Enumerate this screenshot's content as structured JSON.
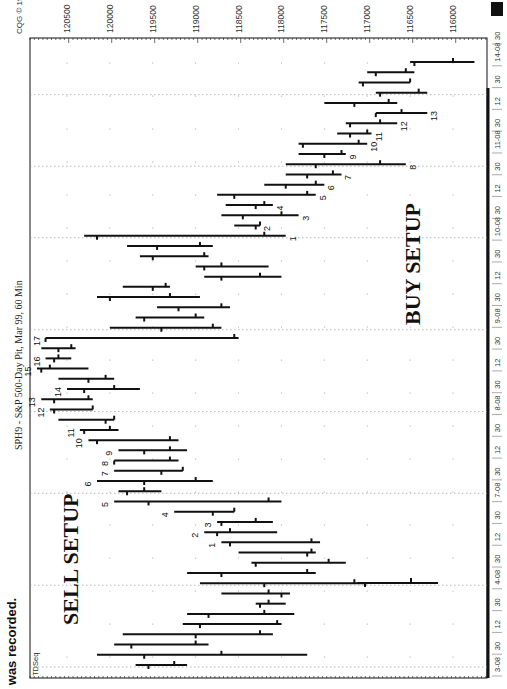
{
  "caption": "was recorded.",
  "chart_data": {
    "type": "ohlc",
    "title": "SPH9 - S&P 500-Day Pit, Mar 99, 60 Min",
    "copyright": "CQG © 1999",
    "indicator_label": "TDSeq",
    "orientation": "rotated 90° counter-clockwise (time runs bottom→top, price decreases left→right)",
    "xlabel": "Time (60-min bars)",
    "ylabel": "Price",
    "y_ticks": [
      120500,
      120000,
      119500,
      119000,
      118500,
      118000,
      117500,
      117000,
      116500,
      116000
    ],
    "ylim": [
      115700,
      120850
    ],
    "x_tick_labels": [
      "3-08",
      "30",
      "12",
      "30",
      "4-08",
      "30",
      "12",
      "30",
      "7-08",
      "30",
      "12",
      "30",
      "8-08",
      "30",
      "12",
      "30",
      "9-08",
      "30",
      "12",
      "30",
      "10-08",
      "30",
      "12",
      "30",
      "11-08",
      "30",
      "12",
      "30",
      "14-08",
      "30"
    ],
    "grid": true,
    "annotations": [
      {
        "text": "SELL SETUP",
        "near_bar": 8
      },
      {
        "text": "BUY SETUP",
        "near_bar": 45
      }
    ],
    "sell_setup_counts": [
      "1",
      "2",
      "3",
      "4",
      "5",
      "6",
      "7",
      "8",
      "9",
      "10",
      "11",
      "12",
      "13",
      "14",
      "15",
      "16",
      "17"
    ],
    "buy_setup_counts": [
      "1",
      "2",
      "3",
      "4",
      "5",
      "6",
      "7",
      "8",
      "9",
      "10",
      "11",
      "12",
      "13"
    ],
    "bars": [
      {
        "i": 0,
        "high": 119700,
        "low": 119100,
        "open": 119550,
        "close": 119250
      },
      {
        "i": 1,
        "high": 120150,
        "low": 117700,
        "open": 119600,
        "close": 118700
      },
      {
        "i": 2,
        "high": 119950,
        "low": 118850,
        "open": 119750,
        "close": 119000
      },
      {
        "i": 3,
        "high": 119850,
        "low": 118100,
        "open": 119000,
        "close": 118250
      },
      {
        "i": 4,
        "high": 119150,
        "low": 118000,
        "open": 118950,
        "close": 118050
      },
      {
        "i": 5,
        "high": 119100,
        "low": 117850,
        "open": 118850,
        "close": 118200
      },
      {
        "i": 6,
        "high": 118300,
        "low": 117950,
        "open": 118250,
        "close": 118150
      },
      {
        "i": 7,
        "high": 118700,
        "low": 117900,
        "open": 118000,
        "close": 118150
      },
      {
        "i": 8,
        "high": 118950,
        "low": 117000,
        "open": 118200,
        "close": 117150
      },
      {
        "i": 9,
        "high": 119100,
        "low": 117600,
        "open": 118700,
        "close": 117700
      },
      {
        "i": 10,
        "high": 118350,
        "low": 117250,
        "open": 118300,
        "close": 117450
      },
      {
        "i": 11,
        "high": 118500,
        "low": 117600,
        "open": 117700,
        "close": 117650
      },
      {
        "i": 12,
        "high": 118700,
        "low": 117550,
        "open": 118600,
        "close": 117650,
        "count": "1",
        "setup": "sell"
      },
      {
        "i": 13,
        "high": 118900,
        "low": 118050,
        "open": 118750,
        "close": 118600,
        "count": "2",
        "setup": "sell"
      },
      {
        "i": 14,
        "high": 118750,
        "low": 118100,
        "open": 118700,
        "close": 118300,
        "count": "3",
        "setup": "sell"
      },
      {
        "i": 15,
        "high": 119250,
        "low": 118550,
        "open": 118800,
        "close": 118550,
        "count": "4",
        "setup": "sell"
      },
      {
        "i": 16,
        "high": 119950,
        "low": 118000,
        "open": 119550,
        "close": 118150,
        "count": "5",
        "setup": "sell"
      },
      {
        "i": 17,
        "high": 119900,
        "low": 119400,
        "open": 119800,
        "close": 119600
      },
      {
        "i": 18,
        "high": 120150,
        "low": 118800,
        "open": 119600,
        "close": 119000,
        "count": "6",
        "setup": "sell"
      },
      {
        "i": 19,
        "high": 119950,
        "low": 119150,
        "open": 119400,
        "close": 119150,
        "count": "7",
        "setup": "sell"
      },
      {
        "i": 20,
        "high": 119950,
        "low": 119200,
        "open": 119950,
        "close": 119300,
        "count": "8",
        "setup": "sell"
      },
      {
        "i": 21,
        "high": 119900,
        "low": 119100,
        "open": 119600,
        "close": 119300,
        "count": "9",
        "setup": "sell"
      },
      {
        "i": 22,
        "high": 120250,
        "low": 119200,
        "open": 120150,
        "close": 119300,
        "count": "10",
        "setup": "sell"
      },
      {
        "i": 23,
        "high": 120350,
        "low": 119900,
        "open": 120300,
        "close": 120000,
        "count": "11",
        "setup": "sell"
      },
      {
        "i": 24,
        "high": 120600,
        "low": 119950,
        "open": 120050,
        "close": 119950
      },
      {
        "i": 25,
        "high": 120700,
        "low": 120200,
        "open": 120650,
        "close": 120200,
        "count": "12",
        "setup": "sell"
      },
      {
        "i": 26,
        "high": 120800,
        "low": 120200,
        "open": 120650,
        "close": 120250,
        "count": "13",
        "setup": "sell"
      },
      {
        "i": 27,
        "high": 120500,
        "low": 119650,
        "open": 120300,
        "close": 119950,
        "count": "14",
        "setup": "sell"
      },
      {
        "i": 28,
        "high": 120600,
        "low": 119950,
        "open": 120250,
        "close": 120050
      },
      {
        "i": 29,
        "high": 120850,
        "low": 120250,
        "open": 120800,
        "close": 120700,
        "count": "15",
        "setup": "sell"
      },
      {
        "i": 30,
        "high": 120750,
        "low": 120450,
        "open": 120650,
        "close": 120600,
        "count": "16",
        "setup": "sell"
      },
      {
        "i": 31,
        "high": 120800,
        "low": 120400,
        "open": 120600,
        "close": 120450
      },
      {
        "i": 32,
        "high": 120750,
        "low": 118500,
        "open": 120750,
        "close": 118550,
        "count": "17",
        "setup": "sell"
      },
      {
        "i": 33,
        "high": 120000,
        "low": 118700,
        "open": 119400,
        "close": 118800
      },
      {
        "i": 34,
        "high": 119700,
        "low": 118900,
        "open": 119600,
        "close": 119000
      },
      {
        "i": 35,
        "high": 119450,
        "low": 118600,
        "open": 119200,
        "close": 118700
      },
      {
        "i": 36,
        "high": 120150,
        "low": 118950,
        "open": 120000,
        "close": 119300
      },
      {
        "i": 37,
        "high": 119850,
        "low": 119300,
        "open": 119500,
        "close": 119350
      },
      {
        "i": 38,
        "high": 118900,
        "low": 118000,
        "open": 118700,
        "close": 118250
      },
      {
        "i": 39,
        "high": 119000,
        "low": 118150,
        "open": 118900,
        "close": 118700
      },
      {
        "i": 40,
        "high": 119650,
        "low": 118850,
        "open": 119500,
        "close": 118900
      },
      {
        "i": 41,
        "high": 119800,
        "low": 118800,
        "open": 119450,
        "close": 118950
      },
      {
        "i": 42,
        "high": 120300,
        "low": 117950,
        "open": 120150,
        "close": 118200,
        "count": "1",
        "setup": "buy"
      },
      {
        "i": 43,
        "high": 118550,
        "low": 118250,
        "open": 118300,
        "close": 118250,
        "count": "2",
        "setup": "buy"
      },
      {
        "i": 44,
        "high": 118700,
        "low": 117800,
        "open": 118450,
        "close": 118000,
        "count": "3",
        "setup": "buy"
      },
      {
        "i": 45,
        "high": 118650,
        "low": 118100,
        "open": 118300,
        "close": 118200,
        "count": "4",
        "setup": "buy"
      },
      {
        "i": 46,
        "high": 118750,
        "low": 117600,
        "open": 118550,
        "close": 117700,
        "count": "5",
        "setup": "buy"
      },
      {
        "i": 47,
        "high": 118200,
        "low": 117500,
        "open": 117950,
        "close": 117600,
        "count": "6",
        "setup": "buy"
      },
      {
        "i": 48,
        "high": 117950,
        "low": 117300,
        "open": 117700,
        "close": 117400,
        "count": "7",
        "setup": "buy"
      },
      {
        "i": 49,
        "high": 117950,
        "low": 116550,
        "open": 117600,
        "close": 116850,
        "count": "8",
        "setup": "buy"
      },
      {
        "i": 50,
        "high": 117800,
        "low": 117250,
        "open": 117500,
        "close": 117300,
        "count": "9",
        "setup": "buy"
      },
      {
        "i": 51,
        "high": 117800,
        "low": 117000,
        "open": 117750,
        "close": 117100,
        "count": "10",
        "setup": "buy"
      },
      {
        "i": 52,
        "high": 117350,
        "low": 116950,
        "open": 117200,
        "close": 117000,
        "count": "11",
        "setup": "buy"
      },
      {
        "i": 53,
        "high": 117250,
        "low": 116650,
        "open": 117200,
        "close": 116850,
        "count": "12",
        "setup": "buy"
      },
      {
        "i": 54,
        "high": 116900,
        "low": 116300,
        "open": 116900,
        "close": 116600,
        "count": "13",
        "setup": "buy"
      },
      {
        "i": 55,
        "high": 117500,
        "low": 116650,
        "open": 117150,
        "close": 116750
      },
      {
        "i": 56,
        "high": 116900,
        "low": 116300,
        "open": 116850,
        "close": 116400
      },
      {
        "i": 57,
        "high": 117100,
        "low": 116500,
        "open": 117050,
        "close": 116500
      },
      {
        "i": 58,
        "high": 117000,
        "low": 116450,
        "open": 116900,
        "close": 116550
      },
      {
        "i": 59,
        "high": 116500,
        "low": 115750,
        "open": 116450,
        "close": 116000
      }
    ],
    "isolated_indicator_bar": {
      "high": 117000,
      "low": 116000,
      "note": "horizontal line near 4-08 on the lower right"
    }
  },
  "layout": {
    "ink_color": "#111111",
    "grid_color": "#9a9a9a",
    "background": "#ffffff"
  }
}
